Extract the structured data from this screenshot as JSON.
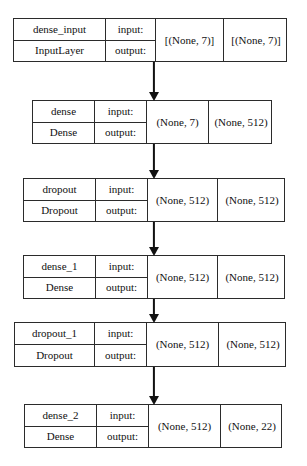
{
  "diagram": {
    "type": "sequential-model-graph",
    "io_labels": {
      "input": "input:",
      "output": "output:"
    },
    "nodes": [
      {
        "id": "dense_input",
        "name": "dense_input",
        "layer_type": "InputLayer",
        "input_shape": "[(None, 7)]",
        "output_shape": "[(None, 7)]",
        "box": {
          "x": 13,
          "y": 18,
          "width": 274,
          "height": 44
        },
        "columns": {
          "name": 92,
          "io": 50,
          "inshape": 68,
          "outshape": 64
        }
      },
      {
        "id": "dense",
        "name": "dense",
        "layer_type": "Dense",
        "input_shape": "(None, 7)",
        "output_shape": "(None, 512)",
        "box": {
          "x": 32,
          "y": 100,
          "width": 240,
          "height": 44
        },
        "columns": {
          "name": 62,
          "io": 52,
          "inshape": 62,
          "outshape": 64
        }
      },
      {
        "id": "dropout",
        "name": "dropout",
        "layer_type": "Dropout",
        "input_shape": "(None, 512)",
        "output_shape": "(None, 512)",
        "box": {
          "x": 23,
          "y": 178,
          "width": 262,
          "height": 44
        },
        "columns": {
          "name": 72,
          "io": 52,
          "inshape": 70,
          "outshape": 68
        }
      },
      {
        "id": "dense_1",
        "name": "dense_1",
        "layer_type": "Dense",
        "input_shape": "(None, 512)",
        "output_shape": "(None, 512)",
        "box": {
          "x": 23,
          "y": 255,
          "width": 262,
          "height": 44
        },
        "columns": {
          "name": 72,
          "io": 52,
          "inshape": 70,
          "outshape": 68
        }
      },
      {
        "id": "dropout_1",
        "name": "dropout_1",
        "layer_type": "Dropout",
        "input_shape": "(None, 512)",
        "output_shape": "(None, 512)",
        "box": {
          "x": 14,
          "y": 322,
          "width": 272,
          "height": 45
        },
        "columns": {
          "name": 80,
          "io": 52,
          "inshape": 72,
          "outshape": 68
        }
      },
      {
        "id": "dense_2",
        "name": "dense_2",
        "layer_type": "Dense",
        "input_shape": "(None, 512)",
        "output_shape": "(None, 22)",
        "box": {
          "x": 24,
          "y": 404,
          "width": 258,
          "height": 44
        },
        "columns": {
          "name": 72,
          "io": 52,
          "inshape": 72,
          "outshape": 62
        }
      }
    ],
    "edges": [
      {
        "from": "dense_input",
        "to": "dense",
        "x": 154,
        "y": 62,
        "length": 38
      },
      {
        "from": "dense",
        "to": "dropout",
        "x": 154,
        "y": 144,
        "length": 34
      },
      {
        "from": "dropout",
        "to": "dense_1",
        "x": 154,
        "y": 222,
        "length": 33
      },
      {
        "from": "dense_1",
        "to": "dropout_1",
        "x": 154,
        "y": 299,
        "length": 23
      },
      {
        "from": "dropout_1",
        "to": "dense_2",
        "x": 154,
        "y": 367,
        "length": 37
      }
    ],
    "colors": {
      "border": "#2b2b2b",
      "text": "#111111",
      "arrow": "#111111",
      "background": "#ffffff"
    }
  }
}
